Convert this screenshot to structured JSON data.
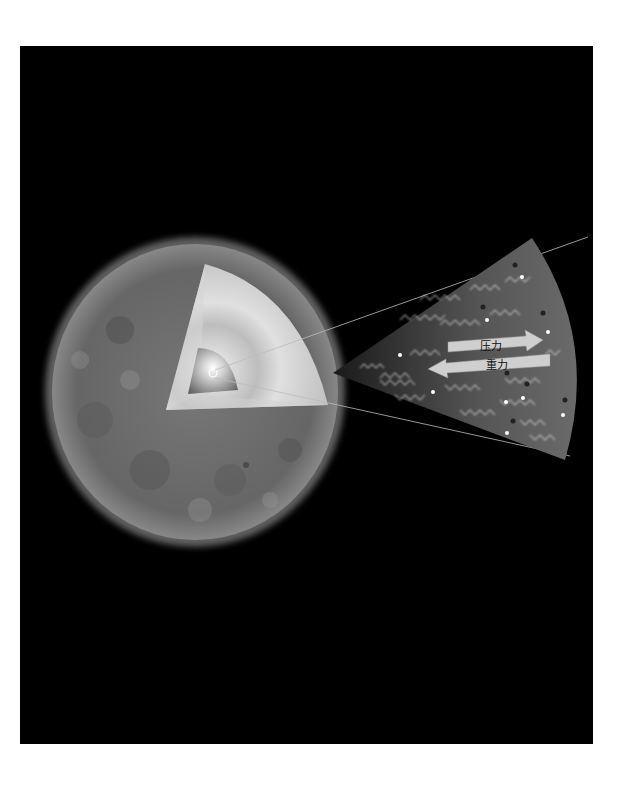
{
  "diagram": {
    "labels": {
      "pressure": "压力",
      "gravity": "重力"
    },
    "colors": {
      "background": "#000000",
      "page": "#ffffff",
      "star_surface": "#6e6e6e",
      "cutaway_light": "#d8d8d8",
      "arrow_fill": "#cfcfcf"
    },
    "components": [
      "star-sphere",
      "cutaway-layers",
      "core",
      "magnified-wedge",
      "pressure-arrow",
      "gravity-arrow",
      "photon-waves",
      "particles"
    ]
  }
}
